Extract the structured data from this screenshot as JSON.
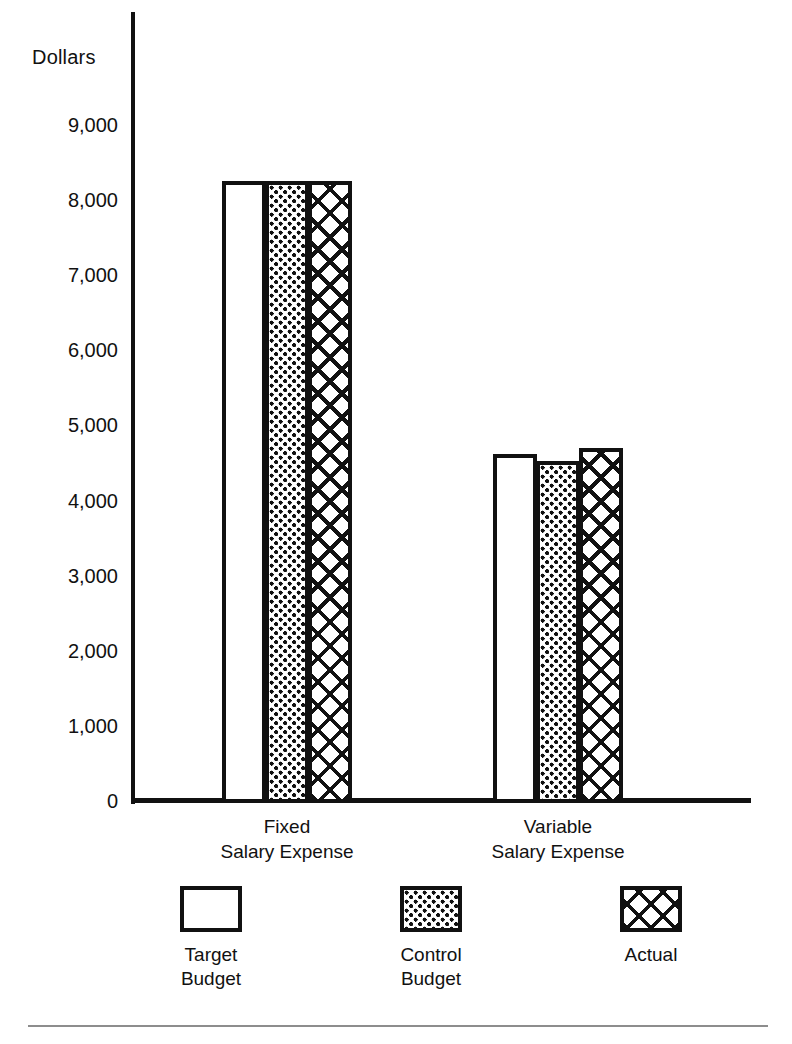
{
  "chart_data": {
    "type": "bar",
    "title": "",
    "xlabel": "",
    "ylabel": "Dollars",
    "ylim": [
      0,
      9000
    ],
    "grid": false,
    "legend_position": "bottom",
    "categories": [
      "Fixed\nSalary Expense",
      "Variable\nSalary Expense"
    ],
    "category_lines": [
      [
        "Fixed",
        "Salary Expense"
      ],
      [
        "Variable",
        "Salary Expense"
      ]
    ],
    "ytick_labels": [
      "9,000",
      "8,000",
      "7,000",
      "6,000",
      "5,000",
      "4,000",
      "3,000",
      "2,000",
      "1,000",
      "0"
    ],
    "ytick_values": [
      9000,
      8000,
      7000,
      6000,
      5000,
      4000,
      3000,
      2000,
      1000,
      0
    ],
    "series": [
      {
        "name": "Target Budget",
        "pattern": "plain",
        "values": [
          8250,
          4620
        ]
      },
      {
        "name": "Control Budget",
        "pattern": "dots",
        "values": [
          8250,
          4530
        ]
      },
      {
        "name": "Actual",
        "pattern": "hatch",
        "values": [
          8250,
          4700
        ]
      }
    ],
    "legend": [
      {
        "label": "Target\nBudget",
        "lines": [
          "Target",
          "Budget"
        ],
        "pattern": "plain"
      },
      {
        "label": "Control\nBudget",
        "lines": [
          "Control",
          "Budget"
        ],
        "pattern": "dots"
      },
      {
        "label": "Actual",
        "lines": [
          "Actual"
        ],
        "pattern": "hatch"
      }
    ],
    "colors": {
      "ink": "#111111",
      "background": "#ffffff",
      "rule": "#8d8d8d"
    }
  }
}
